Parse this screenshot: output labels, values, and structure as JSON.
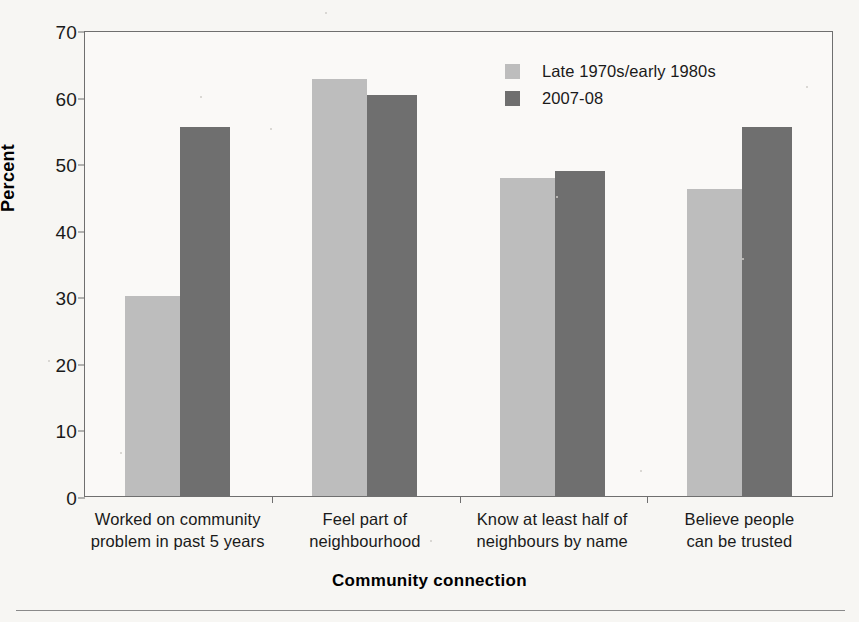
{
  "chart_data": {
    "type": "bar",
    "title": "",
    "xlabel": "Community connection",
    "ylabel": "Percent",
    "ylim": [
      0,
      70
    ],
    "ytick_step": 10,
    "yticks": [
      "70",
      "60",
      "50",
      "40",
      "30",
      "20",
      "10",
      "0"
    ],
    "grid": false,
    "legend_position": "top-right",
    "categories": [
      "Worked on community\nproblem in past 5 years",
      "Feel part of\nneighbourhood",
      "Know at least half of\nneighbours by name",
      "Believe people\ncan be trusted"
    ],
    "series": [
      {
        "name": "Late 1970s/early 1980s",
        "color": "#bdbdbd",
        "values": [
          30.0,
          62.6,
          47.8,
          46.1
        ]
      },
      {
        "name": "2007-08",
        "color": "#6f6f6f",
        "values": [
          55.5,
          60.2,
          48.8,
          55.4
        ]
      }
    ]
  },
  "legend": {
    "items": [
      {
        "label": "Late 1970s/early 1980s",
        "color": "#bdbdbd"
      },
      {
        "label": "2007-08",
        "color": "#6f6f6f"
      }
    ]
  },
  "axes": {
    "y_title": "Percent",
    "x_title": "Community connection",
    "y_ticks": [
      "70",
      "60",
      "50",
      "40",
      "30",
      "20",
      "10",
      "0"
    ],
    "x_labels": [
      "Worked on community\nproblem in past 5 years",
      "Feel part of\nneighbourhood",
      "Know at least half of\nneighbours by name",
      "Believe people\ncan be trusted"
    ]
  },
  "colors": {
    "background": "#f7f6f3",
    "plot_background": "#faf9f7",
    "axis": "#6f6f6f",
    "series_light": "#bdbdbd",
    "series_dark": "#6f6f6f",
    "text": "#1a1a1a"
  }
}
